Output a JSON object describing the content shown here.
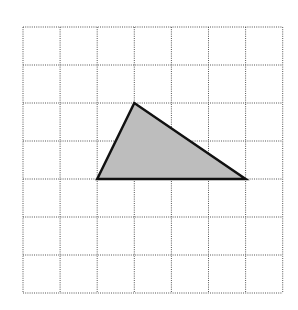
{
  "diagram": {
    "type": "grid-with-triangle",
    "grid": {
      "columns": 7,
      "rows": 7,
      "origin_x": 23,
      "origin_y": 27,
      "cell_width": 37.1,
      "cell_height": 38,
      "line_color": "#555555",
      "line_style": "dotted"
    },
    "triangle": {
      "vertices_grid": [
        [
          2,
          4
        ],
        [
          3,
          2
        ],
        [
          6,
          4
        ]
      ],
      "fill_color": "#bdbdbd",
      "stroke_color": "#111111",
      "stroke_width": 2.5
    }
  }
}
